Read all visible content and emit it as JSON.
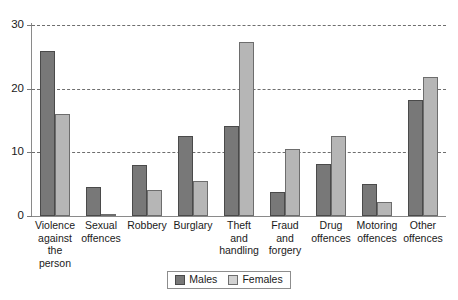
{
  "chart_data": {
    "type": "bar",
    "title": "",
    "subtitle": "",
    "xlabel": "",
    "ylabel": "",
    "ylim": [
      0,
      30
    ],
    "yticks": [
      0,
      10,
      20,
      30
    ],
    "ytick_labels": [
      "0",
      "10",
      "20",
      "30"
    ],
    "grid": "horizontal-dashed",
    "legend_position": "bottom-center",
    "categories": [
      "Violence against the person",
      "Sexual offences",
      "Robbery",
      "Burglary",
      "Theft and handling",
      "Fraud and forgery",
      "Drug offences",
      "Motoring offences",
      "Other offences"
    ],
    "category_lines": [
      [
        "Violence",
        "against the",
        "person"
      ],
      [
        "Sexual",
        "offences"
      ],
      [
        "Robbery"
      ],
      [
        "Burglary"
      ],
      [
        "Theft and",
        "handling"
      ],
      [
        "Fraud and",
        "forgery"
      ],
      [
        "Drug",
        "offences"
      ],
      [
        "Motoring",
        "offences"
      ],
      [
        "Other",
        "offences"
      ]
    ],
    "series": [
      {
        "name": "Males",
        "color": "#787878",
        "values": [
          25.9,
          4.5,
          8.0,
          12.6,
          14.1,
          3.7,
          8.2,
          5.0,
          18.3
        ]
      },
      {
        "name": "Females",
        "color": "#b6b6b6",
        "values": [
          16.0,
          0.3,
          4.1,
          5.5,
          27.3,
          10.6,
          12.5,
          2.2,
          21.9
        ]
      }
    ]
  },
  "legend": {
    "items": [
      {
        "label": "Males"
      },
      {
        "label": "Females"
      }
    ]
  }
}
